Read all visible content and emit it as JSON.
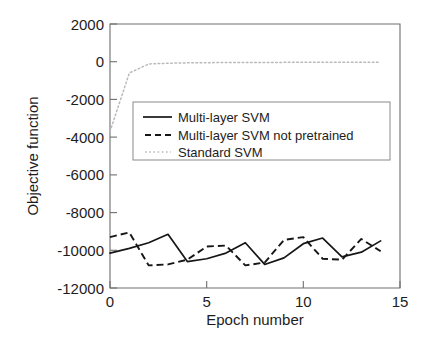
{
  "chart_data": {
    "type": "line",
    "title": "",
    "xlabel": "Epoch number",
    "ylabel": "Objective function",
    "xlim": [
      0,
      15
    ],
    "ylim": [
      -12000,
      2000
    ],
    "xticks": [
      0,
      5,
      10,
      15
    ],
    "yticks": [
      2000,
      0,
      -2000,
      -4000,
      -6000,
      -8000,
      -10000,
      -12000
    ],
    "xtick_labels": [
      "0",
      "5",
      "10",
      "15"
    ],
    "ytick_labels": [
      "2000",
      "0",
      "-2000",
      "-4000",
      "-6000",
      "-8000",
      "-10000",
      "-12000"
    ],
    "grid": false,
    "legend_position": "upper-center",
    "x": [
      0,
      1,
      2,
      3,
      4,
      5,
      6,
      7,
      8,
      9,
      10,
      11,
      12,
      13,
      14
    ],
    "series": [
      {
        "name": "Multi-layer SVM",
        "style": "solid",
        "color": "#161616",
        "values": [
          -10150,
          -9900,
          -9600,
          -9150,
          -10600,
          -10450,
          -10150,
          -9600,
          -10750,
          -10400,
          -9650,
          -9350,
          -10350,
          -10100,
          -9500
        ]
      },
      {
        "name": "Multi-layer SVM not pretrained",
        "style": "dashed",
        "color": "#161616",
        "values": [
          -9300,
          -9050,
          -10800,
          -10750,
          -10500,
          -9800,
          -9750,
          -10800,
          -10650,
          -9450,
          -9300,
          -10450,
          -10500,
          -9400,
          -10050
        ]
      },
      {
        "name": "Standard SVM",
        "style": "dotted",
        "color": "#b9b9b9",
        "values": [
          -3700,
          -600,
          -120,
          -80,
          -60,
          -50,
          -45,
          -40,
          -38,
          -35,
          -32,
          -30,
          -28,
          -26,
          -25
        ]
      }
    ]
  },
  "legend": {
    "entries": [
      {
        "label": "Multi-layer SVM",
        "style": "solid"
      },
      {
        "label": "Multi-layer SVM not pretrained",
        "style": "dashed"
      },
      {
        "label": "Standard SVM",
        "style": "dotted"
      }
    ]
  },
  "axes": {
    "x_title": "Epoch number",
    "y_title": "Objective function"
  }
}
